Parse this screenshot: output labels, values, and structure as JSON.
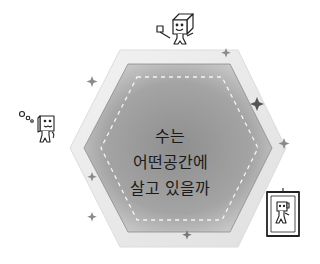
{
  "title": {
    "lines": [
      "수는",
      "어떤공간에",
      "살고 있을까"
    ]
  },
  "characters": [
    {
      "name": "cube-character-with-flag",
      "position": "top"
    },
    {
      "name": "cube-character-thinking",
      "position": "left"
    },
    {
      "name": "framed-cube-portrait",
      "position": "bottom-right"
    }
  ],
  "colors": {
    "background": "#ffffff",
    "hex_outer": "#e4e4e4",
    "hex_inner_center": "#9a9a9a",
    "hex_inner_edge": "#c8c8c8",
    "dash": "#f4f4f4",
    "text": "#1a1a1a",
    "sparkle": "#8a8a8a"
  }
}
